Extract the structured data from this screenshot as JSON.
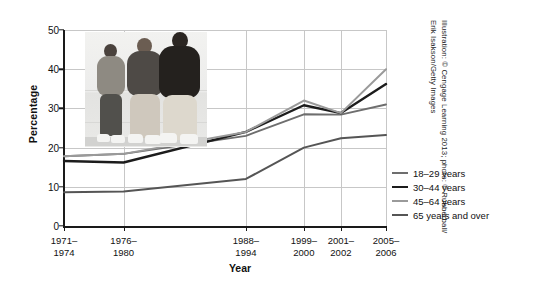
{
  "axis": {
    "ylabel": "Percentage",
    "xlabel": "Year"
  },
  "credit": {
    "line1": "Illustration: © Cengage Learning 2013; photo: © Rubberball/",
    "line2": "Erik Isakson/Getty Images"
  },
  "legend": {
    "items": [
      {
        "label": "18–29 years",
        "color": "#6e6e6e"
      },
      {
        "label": "30–44 years",
        "color": "#1c1c1c"
      },
      {
        "label": "45–64 years",
        "color": "#9a9a9a"
      },
      {
        "label": "65 years and over",
        "color": "#555555"
      }
    ]
  },
  "chart_data": {
    "type": "line",
    "title": "",
    "xlabel": "Year",
    "ylabel": "Percentage",
    "categories": [
      "1971–\n1974",
      "1976–\n1980",
      "1988–\n1994",
      "1999–\n2000",
      "2001–\n2002",
      "2005–\n2006"
    ],
    "categories_line1": [
      "1971–",
      "1976–",
      "1988–",
      "1999–",
      "2001–",
      "2005–"
    ],
    "categories_line2": [
      "1974",
      "1980",
      "1994",
      "2000",
      "2002",
      "2006"
    ],
    "x_positions_pct": [
      0,
      18.5,
      56.5,
      74.5,
      86.0,
      100
    ],
    "ylim": [
      0,
      50
    ],
    "yticks": [
      0,
      10,
      20,
      30,
      40,
      50
    ],
    "grid": true,
    "legend_position": "right",
    "series": [
      {
        "name": "18–29 years",
        "color": "#6e6e6e",
        "width": 1.9,
        "values": [
          17.8,
          18.4,
          23.0,
          28.5,
          28.4,
          31.0
        ]
      },
      {
        "name": "30–44 years",
        "color": "#1c1c1c",
        "width": 2.4,
        "values": [
          16.6,
          16.2,
          24.0,
          30.8,
          28.8,
          36.2
        ]
      },
      {
        "name": "45–64 years",
        "color": "#9a9a9a",
        "width": 2.0,
        "values": [
          17.8,
          18.4,
          24.0,
          32.0,
          28.8,
          40.0
        ]
      },
      {
        "name": "65 years and over",
        "color": "#555555",
        "width": 2.0,
        "values": [
          8.6,
          8.8,
          12.0,
          20.0,
          22.4,
          23.2
        ]
      }
    ]
  }
}
